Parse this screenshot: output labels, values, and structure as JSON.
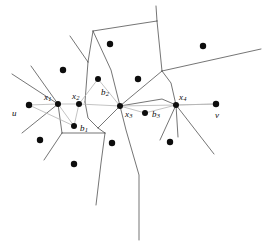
{
  "figure": {
    "type": "voronoi-diagram",
    "width": 266,
    "height": 252,
    "background_color": "#ffffff",
    "cell_edge_color": "#3a3a3a",
    "path_edge_color": "#b4b4b4",
    "dot_color": "#0d0d0d"
  },
  "labels": [
    {
      "id": "u",
      "base": "u",
      "sub": "",
      "x": 12,
      "y": 109
    },
    {
      "id": "x1",
      "base": "x",
      "sub": "1",
      "x": 44,
      "y": 93
    },
    {
      "id": "x2",
      "base": "x",
      "sub": "2",
      "x": 72,
      "y": 92
    },
    {
      "id": "x3",
      "base": "x",
      "sub": "3",
      "x": 125,
      "y": 110
    },
    {
      "id": "x4",
      "base": "x",
      "sub": "4",
      "x": 179,
      "y": 93
    },
    {
      "id": "b1",
      "base": "b",
      "sub": "1",
      "x": 80,
      "y": 124
    },
    {
      "id": "b2",
      "base": "b",
      "sub": "2",
      "x": 101,
      "y": 88
    },
    {
      "id": "b3",
      "base": "b",
      "sub": "3",
      "x": 152,
      "y": 110
    },
    {
      "id": "v",
      "base": "v",
      "sub": "",
      "x": 215,
      "y": 111
    }
  ],
  "path_nodes": [
    {
      "id": "u",
      "cx": 29,
      "cy": 105,
      "r": 3.2
    },
    {
      "id": "x1",
      "cx": 58,
      "cy": 104,
      "r": 3.0
    },
    {
      "id": "x2",
      "cx": 79,
      "cy": 104,
      "r": 3.0
    },
    {
      "id": "x3",
      "cx": 120,
      "cy": 106,
      "r": 3.0
    },
    {
      "id": "x4",
      "cx": 176,
      "cy": 105,
      "r": 3.0
    },
    {
      "id": "v",
      "cx": 216,
      "cy": 104,
      "r": 3.2
    }
  ],
  "bisector_points": [
    {
      "id": "b1",
      "cx": 74,
      "cy": 126,
      "r": 3.0
    },
    {
      "id": "b2",
      "cx": 98,
      "cy": 79,
      "r": 3.0
    },
    {
      "id": "b3",
      "cx": 145,
      "cy": 113,
      "r": 3.0
    }
  ],
  "sites": [
    {
      "id": "s1",
      "cx": 110,
      "cy": 44,
      "r": 3.2
    },
    {
      "id": "s2",
      "cx": 203,
      "cy": 46,
      "r": 3.2
    },
    {
      "id": "s3",
      "cx": 63,
      "cy": 70,
      "r": 3.2
    },
    {
      "id": "s4",
      "cx": 138,
      "cy": 79,
      "r": 3.2
    },
    {
      "id": "s5",
      "cx": 40,
      "cy": 140,
      "r": 3.2
    },
    {
      "id": "s6",
      "cx": 112,
      "cy": 143,
      "r": 3.2
    },
    {
      "id": "s7",
      "cx": 170,
      "cy": 142,
      "r": 3.2
    },
    {
      "id": "s8",
      "cx": 74,
      "cy": 164,
      "r": 3.2
    }
  ],
  "path_segments": [
    {
      "id": "u-x1",
      "points": "29,105 58,104"
    },
    {
      "id": "x1-x2",
      "points": "58,104 79,104"
    },
    {
      "id": "x2-x3",
      "points": "79,104 120,106"
    },
    {
      "id": "x3-x4",
      "points": "120,106 176,105"
    },
    {
      "id": "x4-v",
      "points": "176,105 216,104"
    },
    {
      "id": "x1-b1",
      "points": "58,104 74,126"
    },
    {
      "id": "b1-x2",
      "points": "74,126 79,104"
    },
    {
      "id": "u-b1",
      "points": "29,105 74,126"
    },
    {
      "id": "x2-b2",
      "points": "79,104 98,79"
    },
    {
      "id": "b2-x3",
      "points": "98,79 120,106"
    },
    {
      "id": "x3-b3",
      "points": "120,106 145,113"
    },
    {
      "id": "b3-x4",
      "points": "145,113 176,105"
    },
    {
      "id": "x4-v2",
      "points": "176,105 216,104"
    }
  ],
  "cell_edges": [
    {
      "id": "e-top-center",
      "points": "88,62 93,31"
    },
    {
      "id": "e-upper-left-spur",
      "points": "88,62 70,36"
    },
    {
      "id": "e-upper-right",
      "points": "93,31 131,25 157,21"
    },
    {
      "id": "e-top-stem",
      "points": "157,21 156,6"
    },
    {
      "id": "e-right-upper",
      "points": "157,21 162,71"
    },
    {
      "id": "e-right-long",
      "points": "162,71 261,49"
    },
    {
      "id": "e-center-vert",
      "points": "93,31 111,70 120,106"
    },
    {
      "id": "e-left-vert",
      "points": "88,62 85,102"
    },
    {
      "id": "e-left-star-a",
      "points": "58,104 31,66"
    },
    {
      "id": "e-left-star-b",
      "points": "58,104 12,74"
    },
    {
      "id": "e-left-star-c",
      "points": "58,104 22,133"
    },
    {
      "id": "e-left-star-d",
      "points": "58,104 62,133"
    },
    {
      "id": "e-x2-down",
      "points": "85,102 88,118 98,128"
    },
    {
      "id": "e-b1-cell-left",
      "points": "62,133 105,133"
    },
    {
      "id": "e-b1-cell-spur",
      "points": "62,133 44,160"
    },
    {
      "id": "e-b1-cell-right",
      "points": "105,133 98,128"
    },
    {
      "id": "e-b1-bottom",
      "points": "105,133 101,163 96,205"
    },
    {
      "id": "e-mid-down",
      "points": "98,128 120,106"
    },
    {
      "id": "e-x3-down",
      "points": "120,106 126,130 139,175 139,240"
    },
    {
      "id": "e-x3-right",
      "points": "120,106 162,99 176,105"
    },
    {
      "id": "e-x3-up",
      "points": "120,106 162,71"
    },
    {
      "id": "e-x4-up",
      "points": "176,105 171,83 162,71"
    },
    {
      "id": "e-x4-dr",
      "points": "176,105 214,154"
    },
    {
      "id": "e-x4-dl",
      "points": "176,105 160,140"
    },
    {
      "id": "e-x4-dm",
      "points": "176,105 178,137"
    }
  ]
}
